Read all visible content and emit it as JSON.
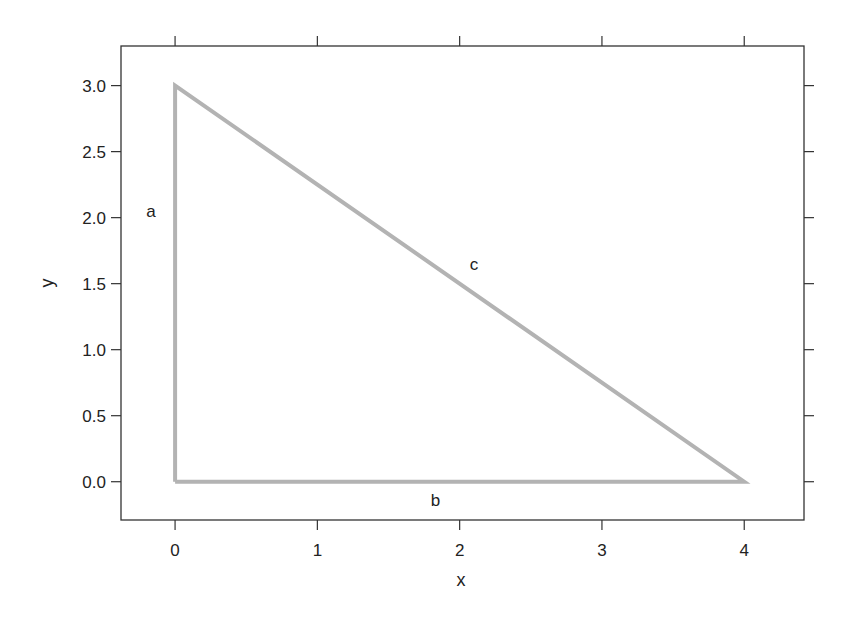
{
  "chart_data": {
    "type": "line",
    "title": "",
    "xlabel": "x",
    "ylabel": "y",
    "xlim": [
      -0.38,
      4.42
    ],
    "ylim": [
      -0.29,
      3.3
    ],
    "grid": false,
    "legend": null,
    "x_ticks": [
      0,
      1,
      2,
      3,
      4
    ],
    "x_tick_labels": [
      "0",
      "1",
      "2",
      "3",
      "4"
    ],
    "y_ticks": [
      0.0,
      0.5,
      1.0,
      1.5,
      2.0,
      2.5,
      3.0
    ],
    "y_tick_labels": [
      "0.0",
      "0.5",
      "1.0",
      "1.5",
      "2.0",
      "2.5",
      "3.0"
    ],
    "series": [
      {
        "name": "triangle",
        "x": [
          0,
          0,
          4,
          0
        ],
        "y": [
          0,
          3,
          0,
          0
        ],
        "color": "#b3b3b3",
        "line_width": 4
      }
    ],
    "annotations": [
      {
        "text": "a",
        "x": -0.17,
        "y": 2.05
      },
      {
        "text": "b",
        "x": 1.83,
        "y": -0.14
      },
      {
        "text": "c",
        "x": 2.1,
        "y": 1.65
      }
    ]
  },
  "colors": {
    "axis": "#333333",
    "series": "#b3b3b3",
    "text": "#222222"
  }
}
